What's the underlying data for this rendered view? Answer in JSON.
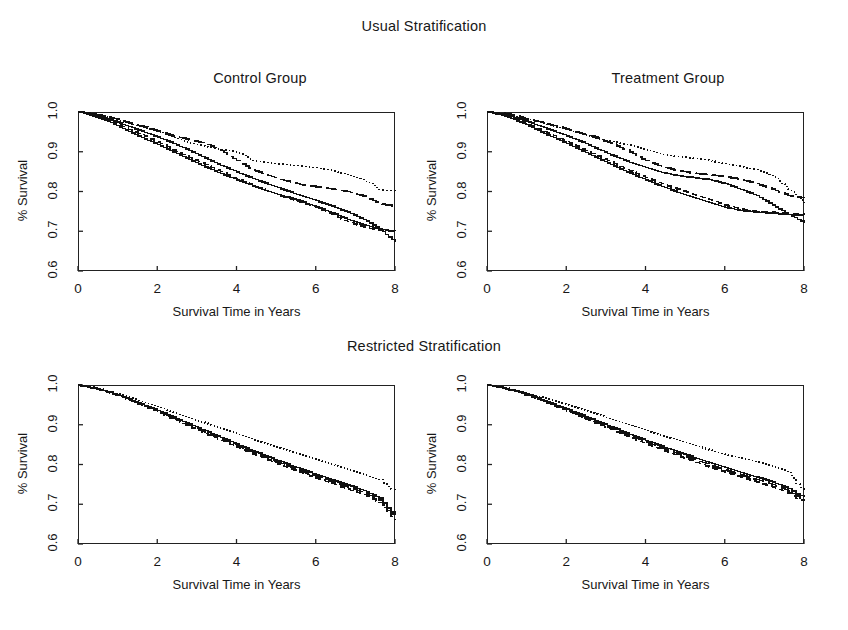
{
  "figure": {
    "section_titles": {
      "usual": "Usual Stratification",
      "restricted": "Restricted Stratification"
    },
    "panel_titles": {
      "control": "Control Group",
      "treatment": "Treatment Group"
    },
    "axis": {
      "ylabel": "% Survival",
      "xlabel": "Survival Time in Years",
      "yticks": [
        "0.6",
        "0.7",
        "0.8",
        "0.9",
        "1.0"
      ],
      "xticks": [
        "0",
        "2",
        "4",
        "6",
        "8"
      ]
    }
  },
  "chart_data": [
    {
      "type": "line",
      "title": "Control Group",
      "supertitle": "Usual Stratification",
      "xlabel": "Survival Time in Years",
      "ylabel": "% Survival",
      "xlim": [
        0,
        8
      ],
      "ylim": [
        0.6,
        1.0
      ],
      "xticks": [
        0,
        2,
        4,
        6,
        8
      ],
      "yticks": [
        0.6,
        0.7,
        0.8,
        0.9,
        1.0
      ],
      "grid": false,
      "legend": "none",
      "series": [
        {
          "name": "stratum-1-solid",
          "style": "solid",
          "x": [
            0.0,
            0.3,
            0.6,
            0.9,
            1.2,
            1.6,
            2.0,
            2.4,
            2.8,
            3.2,
            3.6,
            4.0,
            4.4,
            4.8,
            5.2,
            5.6,
            6.0,
            6.4,
            6.8,
            7.2,
            7.6,
            8.0
          ],
          "values": [
            1.0,
            0.995,
            0.987,
            0.978,
            0.966,
            0.952,
            0.937,
            0.921,
            0.903,
            0.884,
            0.866,
            0.849,
            0.833,
            0.818,
            0.804,
            0.79,
            0.777,
            0.763,
            0.748,
            0.73,
            0.706,
            0.672
          ]
        },
        {
          "name": "stratum-2-dashed",
          "style": "dashed",
          "x": [
            0.0,
            0.3,
            0.6,
            0.9,
            1.2,
            1.6,
            2.0,
            2.4,
            2.8,
            3.2,
            3.6,
            4.0,
            4.4,
            4.8,
            5.2,
            5.6,
            6.0,
            6.4,
            6.8,
            7.2,
            7.6,
            8.0
          ],
          "values": [
            1.0,
            0.994,
            0.985,
            0.974,
            0.96,
            0.943,
            0.924,
            0.905,
            0.886,
            0.868,
            0.85,
            0.832,
            0.815,
            0.8,
            0.786,
            0.773,
            0.76,
            0.742,
            0.724,
            0.711,
            0.702,
            0.7
          ]
        },
        {
          "name": "stratum-3-longdash",
          "style": "longdash",
          "x": [
            0.0,
            0.3,
            0.6,
            0.9,
            1.2,
            1.6,
            2.0,
            2.4,
            2.8,
            3.2,
            3.6,
            4.0,
            4.4,
            4.8,
            5.2,
            5.6,
            6.0,
            6.4,
            6.8,
            7.2,
            7.6,
            8.0
          ],
          "values": [
            1.0,
            0.997,
            0.991,
            0.984,
            0.975,
            0.964,
            0.953,
            0.94,
            0.93,
            0.922,
            0.903,
            0.878,
            0.854,
            0.84,
            0.828,
            0.818,
            0.812,
            0.806,
            0.8,
            0.788,
            0.77,
            0.762
          ]
        },
        {
          "name": "stratum-4-dotted",
          "style": "dotted",
          "x": [
            0.0,
            0.3,
            0.6,
            0.9,
            1.2,
            1.6,
            2.0,
            2.4,
            2.8,
            3.2,
            3.6,
            4.0,
            4.4,
            4.8,
            5.2,
            5.6,
            6.0,
            6.4,
            6.8,
            7.2,
            7.6,
            8.0
          ],
          "values": [
            1.0,
            0.996,
            0.99,
            0.982,
            0.973,
            0.962,
            0.951,
            0.936,
            0.922,
            0.913,
            0.906,
            0.9,
            0.878,
            0.872,
            0.868,
            0.864,
            0.86,
            0.852,
            0.843,
            0.83,
            0.805,
            0.8
          ]
        },
        {
          "name": "stratum-5-solid-lower",
          "style": "solid",
          "x": [
            0.0,
            0.3,
            0.6,
            0.9,
            1.2,
            1.6,
            2.0,
            2.4,
            2.8,
            3.2,
            3.6,
            4.0,
            4.4,
            4.8,
            5.2,
            5.6,
            6.0,
            6.4,
            6.8,
            7.2,
            7.6,
            8.0
          ],
          "values": [
            1.0,
            0.993,
            0.982,
            0.97,
            0.955,
            0.936,
            0.918,
            0.899,
            0.88,
            0.862,
            0.845,
            0.829,
            0.814,
            0.8,
            0.788,
            0.776,
            0.762,
            0.746,
            0.73,
            0.716,
            0.706,
            0.7
          ]
        }
      ]
    },
    {
      "type": "line",
      "title": "Treatment Group",
      "supertitle": "Usual Stratification",
      "xlabel": "Survival Time in Years",
      "ylabel": "% Survival",
      "xlim": [
        0,
        8
      ],
      "ylim": [
        0.6,
        1.0
      ],
      "xticks": [
        0,
        2,
        4,
        6,
        8
      ],
      "yticks": [
        0.6,
        0.7,
        0.8,
        0.9,
        1.0
      ],
      "grid": false,
      "legend": "none",
      "series": [
        {
          "name": "stratum-1-solid",
          "style": "solid",
          "x": [
            0.0,
            0.3,
            0.6,
            0.9,
            1.2,
            1.6,
            2.0,
            2.4,
            2.8,
            3.2,
            3.6,
            4.0,
            4.4,
            4.8,
            5.2,
            5.6,
            6.0,
            6.4,
            6.8,
            7.2,
            7.6,
            8.0
          ],
          "values": [
            1.0,
            0.996,
            0.989,
            0.98,
            0.969,
            0.955,
            0.94,
            0.924,
            0.906,
            0.889,
            0.873,
            0.86,
            0.848,
            0.84,
            0.835,
            0.83,
            0.82,
            0.805,
            0.79,
            0.766,
            0.742,
            0.722
          ]
        },
        {
          "name": "stratum-2-dashed",
          "style": "dashed",
          "x": [
            0.0,
            0.3,
            0.6,
            0.9,
            1.2,
            1.6,
            2.0,
            2.4,
            2.8,
            3.2,
            3.6,
            4.0,
            4.4,
            4.8,
            5.2,
            5.6,
            6.0,
            6.4,
            6.8,
            7.2,
            7.6,
            8.0
          ],
          "values": [
            1.0,
            0.995,
            0.986,
            0.975,
            0.961,
            0.944,
            0.926,
            0.907,
            0.889,
            0.87,
            0.852,
            0.835,
            0.82,
            0.806,
            0.793,
            0.78,
            0.766,
            0.756,
            0.75,
            0.748,
            0.745,
            0.744
          ]
        },
        {
          "name": "stratum-3-longdash",
          "style": "longdash",
          "x": [
            0.0,
            0.3,
            0.6,
            0.9,
            1.2,
            1.6,
            2.0,
            2.4,
            2.8,
            3.2,
            3.6,
            4.0,
            4.4,
            4.8,
            5.2,
            5.6,
            6.0,
            6.4,
            6.8,
            7.2,
            7.6,
            8.0
          ],
          "values": [
            1.0,
            0.998,
            0.993,
            0.986,
            0.978,
            0.968,
            0.957,
            0.946,
            0.934,
            0.918,
            0.9,
            0.878,
            0.862,
            0.853,
            0.846,
            0.842,
            0.838,
            0.83,
            0.82,
            0.806,
            0.79,
            0.784
          ]
        },
        {
          "name": "stratum-4-dotted",
          "style": "dotted",
          "x": [
            0.0,
            0.3,
            0.6,
            0.9,
            1.2,
            1.6,
            2.0,
            2.4,
            2.8,
            3.2,
            3.6,
            4.0,
            4.4,
            4.8,
            5.2,
            5.6,
            6.0,
            6.4,
            6.8,
            7.2,
            7.6,
            8.0
          ],
          "values": [
            1.0,
            0.997,
            0.992,
            0.985,
            0.977,
            0.967,
            0.956,
            0.944,
            0.932,
            0.924,
            0.917,
            0.905,
            0.893,
            0.888,
            0.884,
            0.878,
            0.87,
            0.862,
            0.855,
            0.84,
            0.806,
            0.772
          ]
        },
        {
          "name": "stratum-5-solid-lower",
          "style": "solid",
          "x": [
            0.0,
            0.3,
            0.6,
            0.9,
            1.2,
            1.6,
            2.0,
            2.4,
            2.8,
            3.2,
            3.6,
            4.0,
            4.4,
            4.8,
            5.2,
            5.6,
            6.0,
            6.4,
            6.8,
            7.2,
            7.6,
            8.0
          ],
          "values": [
            1.0,
            0.994,
            0.984,
            0.972,
            0.957,
            0.939,
            0.921,
            0.902,
            0.883,
            0.864,
            0.846,
            0.829,
            0.813,
            0.798,
            0.785,
            0.772,
            0.76,
            0.752,
            0.748,
            0.745,
            0.742,
            0.74
          ]
        }
      ]
    },
    {
      "type": "line",
      "title": "",
      "supertitle": "Restricted Stratification",
      "panel_group": "Control Group",
      "xlabel": "Survival Time in Years",
      "ylabel": "% Survival",
      "xlim": [
        0,
        8
      ],
      "ylim": [
        0.6,
        1.0
      ],
      "xticks": [
        0,
        2,
        4,
        6,
        8
      ],
      "yticks": [
        0.6,
        0.7,
        0.8,
        0.9,
        1.0
      ],
      "grid": false,
      "legend": "none",
      "series": [
        {
          "name": "stratum-1-solid",
          "style": "solid",
          "x": [
            0.0,
            0.4,
            0.8,
            1.2,
            1.6,
            2.0,
            2.4,
            2.8,
            3.2,
            3.6,
            4.0,
            4.4,
            4.8,
            5.2,
            5.6,
            6.0,
            6.4,
            6.8,
            7.2,
            7.6,
            7.8,
            8.0
          ],
          "values": [
            1.0,
            0.992,
            0.982,
            0.968,
            0.952,
            0.936,
            0.919,
            0.902,
            0.885,
            0.868,
            0.851,
            0.835,
            0.819,
            0.804,
            0.789,
            0.775,
            0.761,
            0.748,
            0.735,
            0.716,
            0.69,
            0.672
          ]
        },
        {
          "name": "stratum-2-dashed",
          "style": "dashed",
          "x": [
            0.0,
            0.4,
            0.8,
            1.2,
            1.6,
            2.0,
            2.4,
            2.8,
            3.2,
            3.6,
            4.0,
            4.4,
            4.8,
            5.2,
            5.6,
            6.0,
            6.4,
            6.8,
            7.2,
            7.6,
            7.8,
            8.0
          ],
          "values": [
            1.0,
            0.991,
            0.98,
            0.965,
            0.949,
            0.932,
            0.914,
            0.896,
            0.878,
            0.861,
            0.843,
            0.827,
            0.811,
            0.795,
            0.78,
            0.766,
            0.752,
            0.738,
            0.724,
            0.705,
            0.678,
            0.66
          ]
        },
        {
          "name": "stratum-3-longdash",
          "style": "longdash",
          "x": [
            0.0,
            0.4,
            0.8,
            1.2,
            1.6,
            2.0,
            2.4,
            2.8,
            3.2,
            3.6,
            4.0,
            4.4,
            4.8,
            5.2,
            5.6,
            6.0,
            6.4,
            6.8,
            7.2,
            7.6,
            7.8,
            8.0
          ],
          "values": [
            1.0,
            0.9915,
            0.981,
            0.9665,
            0.9505,
            0.934,
            0.9165,
            0.899,
            0.8815,
            0.8645,
            0.847,
            0.831,
            0.815,
            0.7995,
            0.7845,
            0.7705,
            0.7565,
            0.743,
            0.7295,
            0.7105,
            0.684,
            0.666
          ]
        },
        {
          "name": "stratum-4-dotted",
          "style": "dotted",
          "x": [
            0.0,
            0.4,
            0.8,
            1.2,
            1.6,
            2.0,
            2.4,
            2.8,
            3.2,
            3.6,
            4.0,
            4.4,
            4.8,
            5.2,
            5.6,
            6.0,
            6.4,
            6.8,
            7.2,
            7.6,
            7.8,
            8.0
          ],
          "values": [
            1.0,
            0.993,
            0.984,
            0.972,
            0.959,
            0.946,
            0.932,
            0.918,
            0.904,
            0.89,
            0.876,
            0.862,
            0.849,
            0.836,
            0.824,
            0.812,
            0.8,
            0.788,
            0.776,
            0.762,
            0.745,
            0.73
          ]
        }
      ]
    },
    {
      "type": "line",
      "title": "",
      "supertitle": "Restricted Stratification",
      "panel_group": "Treatment Group",
      "xlabel": "Survival Time in Years",
      "ylabel": "% Survival",
      "xlim": [
        0,
        8
      ],
      "ylim": [
        0.6,
        1.0
      ],
      "xticks": [
        0,
        2,
        4,
        6,
        8
      ],
      "yticks": [
        0.6,
        0.7,
        0.8,
        0.9,
        1.0
      ],
      "grid": false,
      "legend": "none",
      "series": [
        {
          "name": "stratum-1-solid",
          "style": "solid",
          "x": [
            0.0,
            0.4,
            0.8,
            1.2,
            1.6,
            2.0,
            2.4,
            2.8,
            3.2,
            3.6,
            4.0,
            4.4,
            4.8,
            5.2,
            5.6,
            6.0,
            6.4,
            6.8,
            7.2,
            7.6,
            7.8,
            8.0
          ],
          "values": [
            1.0,
            0.993,
            0.983,
            0.97,
            0.955,
            0.94,
            0.924,
            0.908,
            0.892,
            0.876,
            0.861,
            0.846,
            0.832,
            0.818,
            0.805,
            0.792,
            0.78,
            0.768,
            0.756,
            0.74,
            0.726,
            0.718
          ]
        },
        {
          "name": "stratum-2-dashed",
          "style": "dashed",
          "x": [
            0.0,
            0.4,
            0.8,
            1.2,
            1.6,
            2.0,
            2.4,
            2.8,
            3.2,
            3.6,
            4.0,
            4.4,
            4.8,
            5.2,
            5.6,
            6.0,
            6.4,
            6.8,
            7.2,
            7.6,
            7.8,
            8.0
          ],
          "values": [
            1.0,
            0.992,
            0.981,
            0.967,
            0.951,
            0.935,
            0.918,
            0.901,
            0.885,
            0.868,
            0.852,
            0.837,
            0.822,
            0.808,
            0.794,
            0.781,
            0.768,
            0.756,
            0.744,
            0.728,
            0.714,
            0.708
          ]
        },
        {
          "name": "stratum-3-longdash",
          "style": "longdash",
          "x": [
            0.0,
            0.4,
            0.8,
            1.2,
            1.6,
            2.0,
            2.4,
            2.8,
            3.2,
            3.6,
            4.0,
            4.4,
            4.8,
            5.2,
            5.6,
            6.0,
            6.4,
            6.8,
            7.2,
            7.6,
            7.8,
            8.0
          ],
          "values": [
            1.0,
            0.9925,
            0.982,
            0.9685,
            0.953,
            0.9375,
            0.921,
            0.9045,
            0.8885,
            0.872,
            0.8565,
            0.8415,
            0.827,
            0.813,
            0.7995,
            0.7865,
            0.774,
            0.762,
            0.75,
            0.734,
            0.72,
            0.713
          ]
        },
        {
          "name": "stratum-4-dotted",
          "style": "dotted",
          "x": [
            0.0,
            0.4,
            0.8,
            1.2,
            1.6,
            2.0,
            2.4,
            2.8,
            3.2,
            3.6,
            4.0,
            4.4,
            4.8,
            5.2,
            5.6,
            6.0,
            6.4,
            6.8,
            7.2,
            7.6,
            7.8,
            8.0
          ],
          "values": [
            1.0,
            0.994,
            0.985,
            0.974,
            0.962,
            0.95,
            0.937,
            0.924,
            0.911,
            0.898,
            0.885,
            0.872,
            0.86,
            0.848,
            0.837,
            0.826,
            0.816,
            0.806,
            0.795,
            0.78,
            0.752,
            0.732
          ]
        }
      ]
    }
  ]
}
